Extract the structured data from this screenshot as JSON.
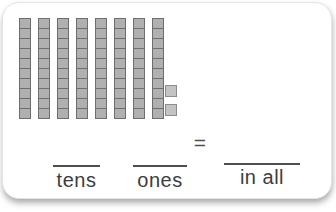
{
  "card": {
    "background": "#ffffff",
    "border_color": "#e3e3e3"
  },
  "blocks": {
    "tens_count": 8,
    "units_per_ten": 10,
    "ones_count": 2,
    "ten_unit_fill": "#b0b0b0",
    "ten_unit_border": "#6e6e6e",
    "one_unit_fill": "#c3c3c3",
    "one_unit_border": "#8d8d8d"
  },
  "equation": {
    "equals_symbol": "=",
    "tens_label": "tens",
    "ones_label": "ones",
    "in_all_label": "in all"
  }
}
